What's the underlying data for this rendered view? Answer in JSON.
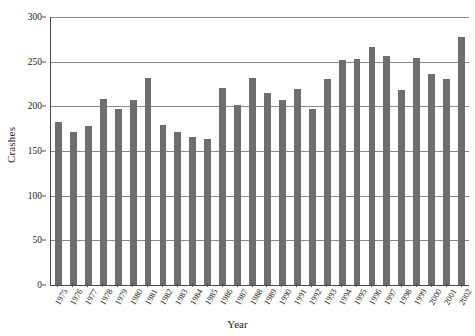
{
  "chart_data": {
    "type": "bar",
    "title": "",
    "xlabel": "Year",
    "ylabel": "Crashes",
    "ylim": [
      0,
      300
    ],
    "yticks": [
      0,
      50,
      100,
      150,
      200,
      250,
      300
    ],
    "grid": true,
    "legend": false,
    "bar_color": "#6e6e6e",
    "axis_color": "#4a4a4a",
    "gridline_color": "#8a8a8a",
    "xtick_rotation": -60,
    "categories": [
      "1975",
      "1976",
      "1977",
      "1978",
      "1979",
      "1980",
      "1981",
      "1982",
      "1983",
      "1984",
      "1985",
      "1986",
      "1987",
      "1988",
      "1989",
      "1990",
      "1991",
      "1992",
      "1993",
      "1994",
      "1995",
      "1996",
      "1997",
      "1998",
      "1999",
      "2000",
      "2001",
      "2002"
    ],
    "values": [
      182,
      171,
      178,
      208,
      197,
      207,
      232,
      179,
      171,
      166,
      163,
      221,
      202,
      232,
      215,
      207,
      219,
      197,
      231,
      252,
      253,
      266,
      256,
      218,
      254,
      236,
      231,
      278
    ],
    "series": [
      {
        "name": "Crashes",
        "values": [
          182,
          171,
          178,
          208,
          197,
          207,
          232,
          179,
          171,
          166,
          163,
          221,
          202,
          232,
          215,
          207,
          219,
          197,
          231,
          252,
          253,
          266,
          256,
          218,
          254,
          236,
          231,
          278
        ]
      }
    ]
  }
}
